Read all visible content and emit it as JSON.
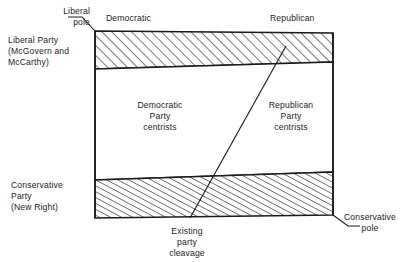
{
  "figure": {
    "type": "political-cleavage-diagram",
    "title": "",
    "background_color": "#ffffff",
    "line_color": "#1a1a1a",
    "hatch_color": "#1a1a1a"
  },
  "labels": {
    "liberal_pole": "Liberal\npole",
    "liberal_party": "Liberal Party\n(McGovern and\nMcCarthy)",
    "conservative_party": "Conservative\nParty\n(New Right)",
    "democratic_top": "Democratic",
    "republican_top": "Republican",
    "democratic_centrists": "Democratic\nParty\ncentrists",
    "republican_centrists": "Republican\nParty\ncentrists",
    "existing_cleavage": "Existing\nparty\ncleavage",
    "conservative_pole": "Conservative\npole"
  },
  "regions": [
    {
      "name": "liberal-band",
      "fill": "hatched",
      "label": "Liberal Party (McGovern and McCarthy)",
      "corners": [
        [
          95,
          31
        ],
        [
          333,
          33
        ],
        [
          333,
          62
        ],
        [
          95,
          69
        ]
      ]
    },
    {
      "name": "centrist-band",
      "fill": "none",
      "label": "Democratic Party centrists / Republican Party centrists",
      "corners": [
        [
          95,
          69
        ],
        [
          333,
          62
        ],
        [
          333,
          172
        ],
        [
          95,
          180
        ]
      ]
    },
    {
      "name": "conservative-band",
      "fill": "hatched",
      "label": "Conservative Party (New Right)",
      "corners": [
        [
          95,
          180
        ],
        [
          333,
          172
        ],
        [
          333,
          215
        ],
        [
          95,
          218
        ]
      ]
    }
  ],
  "cleavage_line": {
    "name": "existing-party-cleavage",
    "from": [
      190,
      218
    ],
    "to": [
      286,
      46
    ]
  },
  "leader_lines": [
    {
      "name": "liberal-pole-leader",
      "from": [
        72,
        18
      ],
      "to": [
        95,
        31
      ]
    },
    {
      "name": "conservative-pole-leader",
      "from": [
        357,
        224
      ],
      "to": [
        333,
        215
      ]
    }
  ]
}
